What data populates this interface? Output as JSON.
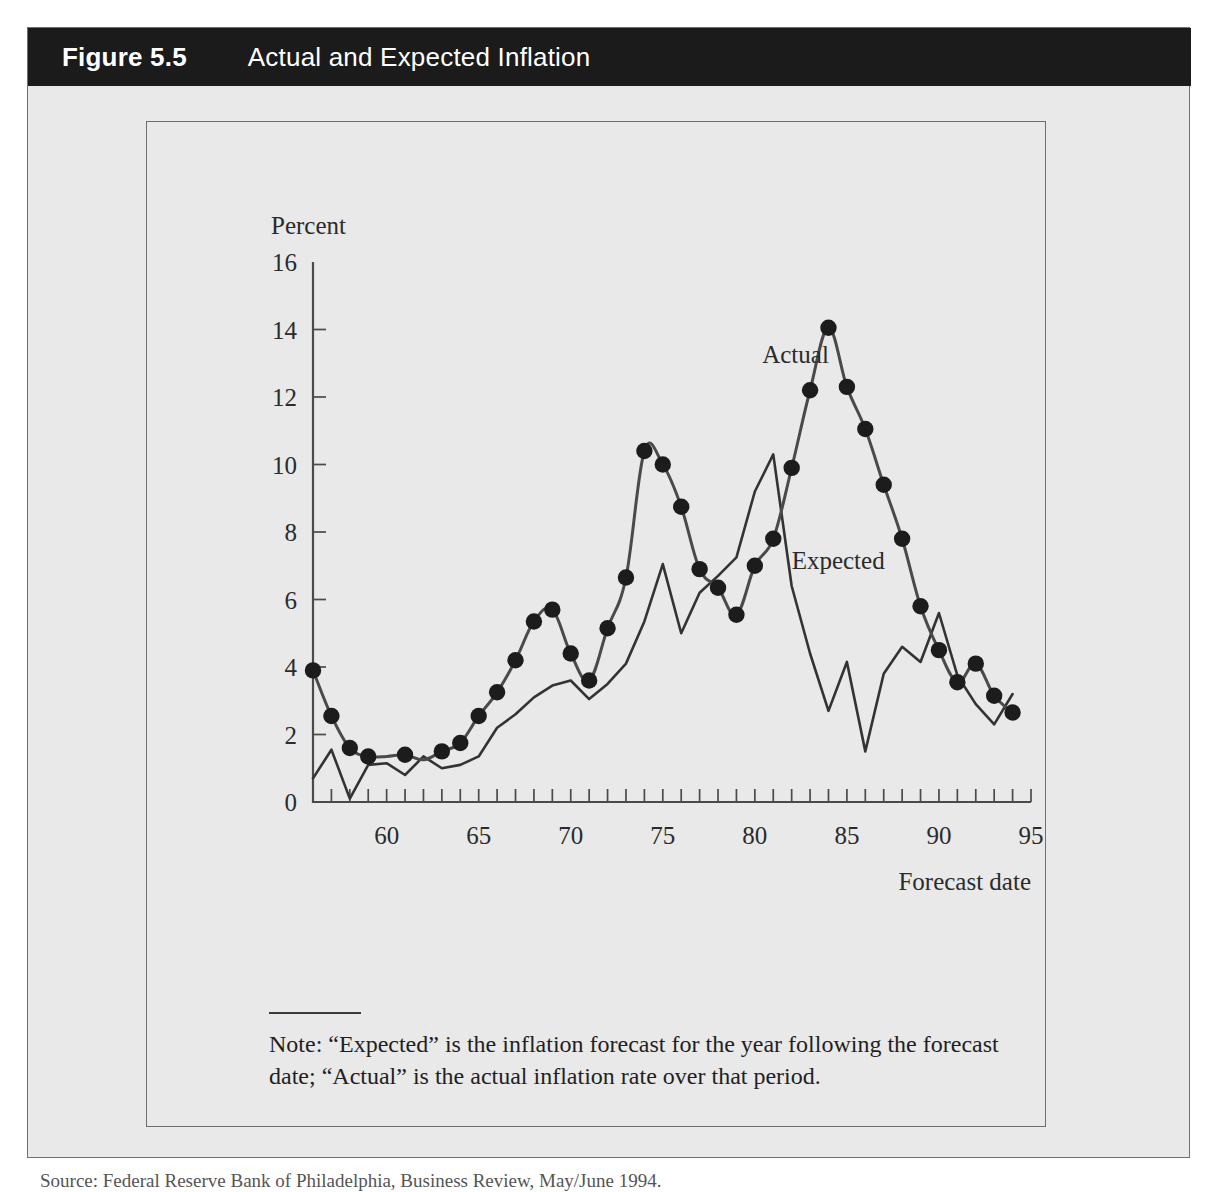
{
  "figure": {
    "number": "Figure 5.5",
    "title": "Actual and Expected Inflation"
  },
  "note": {
    "text": "Note: “Expected” is the inflation forecast for the year following the forecast date; “Actual” is the actual inflation rate over that period."
  },
  "source": {
    "text": "Source: Federal Reserve Bank of Philadelphia, Business Review, May/June 1994."
  },
  "colors": {
    "header_bar": "#1b1b1b",
    "panel_background": "#e9e9e9",
    "panel_border": "#6f6f6f",
    "axis": "#4a4a4a",
    "actual_series": "#4a4a4a",
    "expected_series": "#333333",
    "marker": "#1c1c1c",
    "text": "#2b2b2b"
  },
  "chart_data": {
    "type": "line",
    "title": "Actual and Expected Inflation",
    "xlabel": "Forecast date",
    "ylabel": "Percent",
    "xlim": [
      1956,
      1995
    ],
    "ylim": [
      0,
      16
    ],
    "grid": false,
    "legend_position": "inline-annotation",
    "y_ticks": [
      0,
      2,
      4,
      6,
      8,
      10,
      12,
      14,
      16
    ],
    "x_ticks_labeled": [
      60,
      65,
      70,
      75,
      80,
      85,
      90,
      95
    ],
    "x_tick_interval": 1,
    "annotations": [
      {
        "text": "Actual",
        "x": 1980.4,
        "y": 13.0
      },
      {
        "text": "Expected",
        "x": 1982.0,
        "y": 6.9
      }
    ],
    "series": [
      {
        "name": "Actual",
        "markers": "filled-circle",
        "x": [
          1956,
          1957,
          1958,
          1959,
          1960,
          1961,
          1962,
          1963,
          1964,
          1965,
          1966,
          1967,
          1968,
          1969,
          1970,
          1971,
          1972,
          1973,
          1974,
          1975,
          1976,
          1977,
          1978,
          1979,
          1980,
          1981,
          1982,
          1983,
          1984,
          1985,
          1986,
          1987,
          1988,
          1989,
          1990,
          1991,
          1992,
          1993,
          1994
        ],
        "values": [
          3.9,
          2.55,
          1.6,
          1.35,
          1.35,
          1.4,
          1.25,
          1.5,
          1.75,
          2.55,
          3.25,
          4.2,
          5.35,
          5.7,
          4.4,
          3.6,
          5.15,
          6.65,
          10.4,
          10.0,
          8.75,
          6.9,
          6.35,
          5.55,
          7.0,
          7.8,
          9.9,
          12.2,
          14.05,
          12.3,
          11.05,
          9.4,
          7.8,
          5.8,
          4.5,
          3.55,
          4.1,
          3.15,
          2.65
        ]
      },
      {
        "name": "Expected",
        "markers": "none",
        "x": [
          1956,
          1957,
          1958,
          1959,
          1960,
          1961,
          1962,
          1963,
          1964,
          1965,
          1966,
          1967,
          1968,
          1969,
          1970,
          1971,
          1972,
          1973,
          1974,
          1975,
          1976,
          1977,
          1978,
          1979,
          1980,
          1981,
          1982,
          1983,
          1984,
          1985,
          1986,
          1987,
          1988,
          1989,
          1990,
          1991,
          1992,
          1993,
          1994
        ],
        "values": [
          0.7,
          1.55,
          0.1,
          1.1,
          1.15,
          0.8,
          1.35,
          1.0,
          1.1,
          1.35,
          2.2,
          2.6,
          3.1,
          3.45,
          3.6,
          3.05,
          3.5,
          4.1,
          5.35,
          7.05,
          5.0,
          6.2,
          6.7,
          7.25,
          9.2,
          10.3,
          6.4,
          4.4,
          2.7,
          4.15,
          1.5,
          3.8,
          4.6,
          4.15,
          5.6,
          3.75,
          2.9,
          2.3,
          3.2
        ]
      }
    ],
    "actual_markers": {
      "x": [
        1956,
        1957,
        1958,
        1959,
        1960,
        1961,
        1962,
        1963,
        1964,
        1965,
        1966,
        1967,
        1968,
        1969,
        1970,
        1971,
        1972,
        1973,
        1974,
        1975,
        1976,
        1977,
        1978,
        1979,
        1980,
        1981,
        1982,
        1983,
        1984,
        1985,
        1986,
        1987,
        1988,
        1989,
        1990,
        1991,
        1992,
        1993,
        1994
      ],
      "values": [
        3.9,
        2.55,
        1.6,
        1.35,
        1.35,
        1.4,
        1.25,
        1.5,
        1.75,
        2.55,
        3.25,
        4.2,
        5.35,
        5.7,
        4.4,
        3.6,
        5.15,
        6.65,
        10.4,
        10.0,
        8.75,
        6.9,
        6.35,
        5.55,
        7.0,
        7.8,
        9.9,
        12.2,
        14.05,
        12.3,
        11.05,
        9.4,
        7.8,
        5.8,
        4.5,
        3.55,
        4.1,
        3.15,
        2.65
      ],
      "shown_indices": [
        0,
        1,
        2,
        3,
        5,
        7,
        8,
        9,
        10,
        11,
        12,
        13,
        14,
        15,
        16,
        17,
        18,
        19,
        20,
        21,
        22,
        23,
        24,
        25,
        26,
        27,
        28,
        29,
        30,
        31,
        32,
        33,
        34,
        35,
        36,
        37,
        38
      ]
    }
  }
}
